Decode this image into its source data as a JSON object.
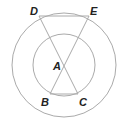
{
  "diagram": {
    "type": "geometry",
    "outer_circle": {
      "cx": 64,
      "cy": 65,
      "r": 52
    },
    "inner_circle": {
      "cx": 64,
      "cy": 65,
      "r": 31
    },
    "color": "#aaaaaa",
    "points": {
      "A": {
        "label": "A",
        "x": 64,
        "y": 65
      },
      "B": {
        "label": "B",
        "x": 50,
        "y": 94
      },
      "C": {
        "label": "C",
        "x": 78,
        "y": 94
      },
      "D": {
        "label": "D",
        "x": 39,
        "y": 16
      },
      "E": {
        "label": "E",
        "x": 89,
        "y": 16
      }
    },
    "segments": [
      "DE",
      "BC",
      "DC",
      "EB"
    ]
  }
}
